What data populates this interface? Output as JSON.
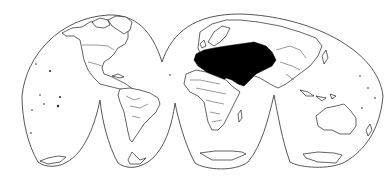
{
  "map": {
    "projection": "interrupted-homolosine",
    "highlighted_region": "Europe, Middle East and Central Asia",
    "colors": {
      "background": "#ffffff",
      "outline": "#444444",
      "land_stroke": "#222222",
      "highlight_fill": "#000000"
    }
  }
}
